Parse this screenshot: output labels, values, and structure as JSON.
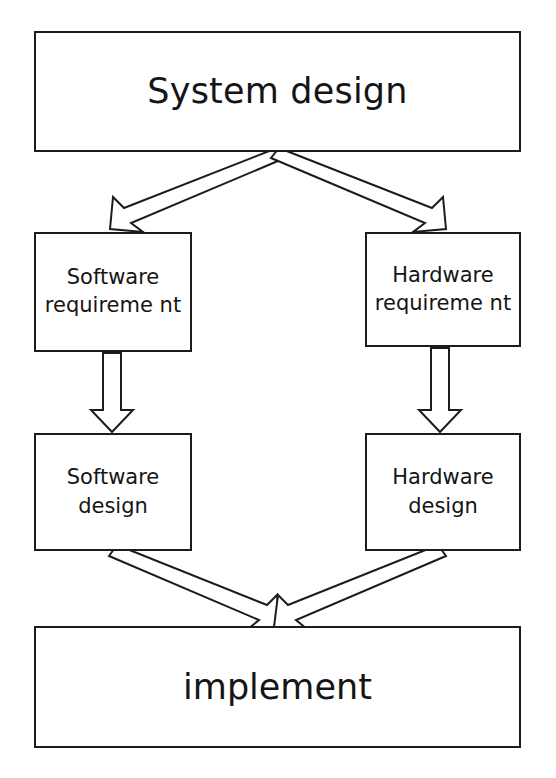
{
  "diagram": {
    "background_color": "#ffffff",
    "line_color": "#1c1c1c",
    "text_color": "#151515",
    "nodes": {
      "system_design": {
        "label": "System design"
      },
      "software_requirement": {
        "label": "Software requireme nt"
      },
      "hardware_requirement": {
        "label": "Hardware requireme nt"
      },
      "software_design": {
        "label": "Software design"
      },
      "hardware_design": {
        "label": "Hardware design"
      },
      "implement": {
        "label": "implement"
      }
    },
    "connectors": [
      {
        "id": "system-to-software-requirement",
        "from": "system_design",
        "to": "software_requirement",
        "style": "block-arrow",
        "direction": "down-left"
      },
      {
        "id": "system-to-hardware-requirement",
        "from": "system_design",
        "to": "hardware_requirement",
        "style": "block-arrow",
        "direction": "down-right"
      },
      {
        "id": "software-requirement-to-software-design",
        "from": "software_requirement",
        "to": "software_design",
        "style": "block-arrow",
        "direction": "down"
      },
      {
        "id": "hardware-requirement-to-hardware-design",
        "from": "hardware_requirement",
        "to": "hardware_design",
        "style": "block-arrow",
        "direction": "down"
      },
      {
        "id": "software-design-to-implement",
        "from": "software_design",
        "to": "implement",
        "style": "block-arrow",
        "direction": "down-right"
      },
      {
        "id": "hardware-design-to-implement",
        "from": "hardware_design",
        "to": "implement",
        "style": "block-arrow",
        "direction": "down-left"
      }
    ]
  }
}
